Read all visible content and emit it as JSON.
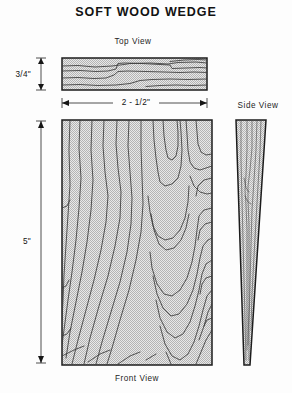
{
  "document": {
    "title": "SOFT WOOD WEDGE",
    "background_color": "#fdfdfd",
    "line_color": "#1c1c1c",
    "fill_color": "#c9c9c9"
  },
  "views": {
    "top": {
      "label": "Top View",
      "shape": "rectangle"
    },
    "front": {
      "label": "Front View",
      "shape": "rectangle"
    },
    "side": {
      "label": "Side View",
      "shape": "tapered-wedge"
    }
  },
  "dimensions": {
    "thickness": {
      "value": "3/4\"",
      "orientation": "vertical",
      "applies_to": "Top View"
    },
    "width": {
      "value": "2 - 1/2\"",
      "orientation": "horizontal",
      "applies_to": "Front View"
    },
    "length": {
      "value": "5\"",
      "orientation": "vertical",
      "applies_to": "Front View"
    }
  }
}
